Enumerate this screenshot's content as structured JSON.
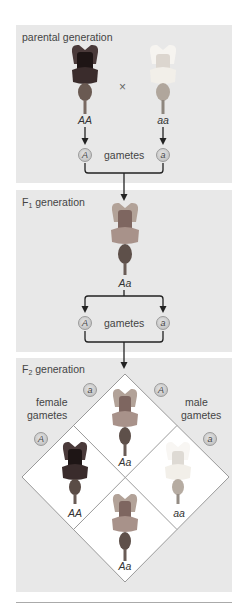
{
  "diagram": {
    "colors": {
      "panel_bg": "#e8e8e8",
      "diamond_fill": "#ffffff",
      "diamond_stroke": "#9a9a9a",
      "arrow": "#222222",
      "flower_dark": "#3a2a2a",
      "flower_medium": "#9a8478",
      "flower_light": "#f2f0ec"
    },
    "parental": {
      "title": "parental generation",
      "cross_symbol": "×",
      "left_genotype": "AA",
      "right_genotype": "aa",
      "left_gamete": "A",
      "right_gamete": "a",
      "gametes_label": "gametes"
    },
    "f1": {
      "title_prefix": "F",
      "title_sub": "1",
      "title_suffix": " generation",
      "genotype": "Aa",
      "left_gamete": "A",
      "right_gamete": "a",
      "gametes_label": "gametes"
    },
    "f2": {
      "title_prefix": "F",
      "title_sub": "2",
      "title_suffix": " generation",
      "female_label_1": "female",
      "female_label_2": "gametes",
      "male_label_1": "male",
      "male_label_2": "gametes",
      "female_gametes": [
        "a",
        "A"
      ],
      "male_gametes": [
        "A",
        "a"
      ],
      "cells": {
        "top": "Aa",
        "left": "AA",
        "right": "aa",
        "bottom": "Aa"
      }
    }
  }
}
